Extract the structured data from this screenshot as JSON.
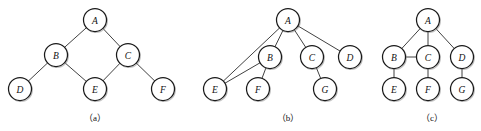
{
  "figure": {
    "background_color": "#ffffff",
    "node_fill": "#ffffff",
    "node_stroke": "#1a1a1a",
    "edge_color": "#2b2b2b",
    "label_color": "#111111",
    "node_radius": 11.5
  },
  "graphs": [
    {
      "id": "graph-a",
      "caption": "（a）",
      "caption_x": 95,
      "caption_y": 118,
      "nodes": [
        {
          "id": "a-A",
          "label": "A",
          "x": 95,
          "y": 20
        },
        {
          "id": "a-B",
          "label": "B",
          "x": 56,
          "y": 55
        },
        {
          "id": "a-C",
          "label": "C",
          "x": 128,
          "y": 55
        },
        {
          "id": "a-D",
          "label": "D",
          "x": 20,
          "y": 89
        },
        {
          "id": "a-E",
          "label": "E",
          "x": 95,
          "y": 89
        },
        {
          "id": "a-F",
          "label": "F",
          "x": 163,
          "y": 89
        }
      ],
      "edges": [
        {
          "from": "a-A",
          "to": "a-B"
        },
        {
          "from": "a-A",
          "to": "a-C"
        },
        {
          "from": "a-B",
          "to": "a-D"
        },
        {
          "from": "a-B",
          "to": "a-E"
        },
        {
          "from": "a-C",
          "to": "a-E"
        },
        {
          "from": "a-C",
          "to": "a-F"
        }
      ]
    },
    {
      "id": "graph-b",
      "caption": "（b）",
      "caption_x": 288,
      "caption_y": 118,
      "nodes": [
        {
          "id": "b-A",
          "label": "A",
          "x": 288,
          "y": 20
        },
        {
          "id": "b-B",
          "label": "B",
          "x": 270,
          "y": 57
        },
        {
          "id": "b-C",
          "label": "C",
          "x": 312,
          "y": 57
        },
        {
          "id": "b-D",
          "label": "D",
          "x": 350,
          "y": 57
        },
        {
          "id": "b-E",
          "label": "E",
          "x": 215,
          "y": 89
        },
        {
          "id": "b-F",
          "label": "F",
          "x": 258,
          "y": 89
        },
        {
          "id": "b-G",
          "label": "G",
          "x": 325,
          "y": 89
        }
      ],
      "edges": [
        {
          "from": "b-A",
          "to": "b-B"
        },
        {
          "from": "b-A",
          "to": "b-C"
        },
        {
          "from": "b-A",
          "to": "b-D"
        },
        {
          "from": "b-A",
          "to": "b-E"
        },
        {
          "from": "b-B",
          "to": "b-E"
        },
        {
          "from": "b-B",
          "to": "b-F"
        },
        {
          "from": "b-C",
          "to": "b-G"
        }
      ]
    },
    {
      "id": "graph-c",
      "caption": "（c）",
      "caption_x": 432,
      "caption_y": 118,
      "nodes": [
        {
          "id": "c-A",
          "label": "A",
          "x": 428,
          "y": 20
        },
        {
          "id": "c-B",
          "label": "B",
          "x": 394,
          "y": 57
        },
        {
          "id": "c-C",
          "label": "C",
          "x": 428,
          "y": 57
        },
        {
          "id": "c-D",
          "label": "D",
          "x": 462,
          "y": 57
        },
        {
          "id": "c-E",
          "label": "E",
          "x": 394,
          "y": 89
        },
        {
          "id": "c-F",
          "label": "F",
          "x": 428,
          "y": 89
        },
        {
          "id": "c-G",
          "label": "G",
          "x": 462,
          "y": 89
        }
      ],
      "edges": [
        {
          "from": "c-A",
          "to": "c-B"
        },
        {
          "from": "c-A",
          "to": "c-C"
        },
        {
          "from": "c-A",
          "to": "c-D"
        },
        {
          "from": "c-B",
          "to": "c-C"
        },
        {
          "from": "c-B",
          "to": "c-E"
        },
        {
          "from": "c-C",
          "to": "c-F"
        },
        {
          "from": "c-D",
          "to": "c-G"
        }
      ]
    }
  ]
}
